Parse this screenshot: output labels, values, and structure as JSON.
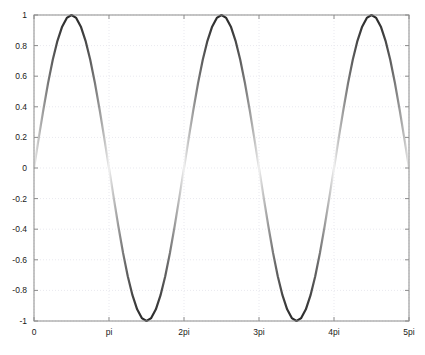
{
  "chart_data": {
    "type": "line",
    "title": "",
    "subtitle": "",
    "xlabel": "",
    "ylabel": "",
    "xlim": [
      0,
      15.70796
    ],
    "ylim": [
      -1.0,
      1.0
    ],
    "grid": true,
    "grid_style": "dotted",
    "legend": null,
    "legend_position": "none",
    "background_color": "#ffffff",
    "axes_color": "#8c8c8c",
    "grid_color": "#e9e9ef",
    "line_color_dark": "#2a2a2a",
    "line_color_light": "#f2f2f2",
    "line_width": 2.2,
    "color_mapping_note": "Line shading varies with |y|: darkest at |y|=1, lightest at y=0",
    "xticks": [
      0,
      3.14159,
      6.28319,
      9.42478,
      12.56637,
      15.70796
    ],
    "xtick_labels": [
      "0",
      "pi",
      "2pi",
      "3pi",
      "4pi",
      "5pi"
    ],
    "yticks": [
      1,
      0.8,
      0.6,
      0.4,
      0.2,
      0,
      -0.2,
      -0.4,
      -0.6,
      -0.8,
      -1
    ],
    "ytick_labels": [
      "1",
      "0.8",
      "0.6",
      "0.4",
      "0.2",
      "0",
      "-0.2",
      "-0.4",
      "-0.6",
      "-0.8",
      "-1"
    ],
    "series": [
      {
        "name": "sin(x)",
        "function": "y = sin(x)",
        "x": [
          0.0,
          0.19635,
          0.3927,
          0.58905,
          0.7854,
          0.98175,
          1.1781,
          1.37445,
          1.5708,
          1.76715,
          1.9635,
          2.15984,
          2.35619,
          2.55254,
          2.74889,
          2.94524,
          3.14159,
          3.33794,
          3.53429,
          3.73064,
          3.92699,
          4.12334,
          4.31969,
          4.51604,
          4.71239,
          4.90874,
          5.10509,
          5.30144,
          5.49779,
          5.69414,
          5.89049,
          6.08684,
          6.28319,
          6.47953,
          6.67588,
          6.87223,
          7.06858,
          7.26493,
          7.46128,
          7.65763,
          7.85398,
          8.05033,
          8.24668,
          8.44303,
          8.63938,
          8.83573,
          9.03208,
          9.22843,
          9.42478,
          9.62113,
          9.81748,
          10.01383,
          10.21018,
          10.40653,
          10.60288,
          10.79922,
          10.99557,
          11.19192,
          11.38827,
          11.58462,
          11.78097,
          11.97732,
          12.17367,
          12.37002,
          12.56637,
          12.76272,
          12.95907,
          13.15542,
          13.35177,
          13.54812,
          13.74447,
          13.94082,
          14.13717,
          14.33352,
          14.52987,
          14.72622,
          14.92257,
          15.11891,
          15.31526,
          15.51161,
          15.70796
        ],
        "y": [
          0.0,
          0.19509,
          0.38268,
          0.55557,
          0.70711,
          0.83147,
          0.92388,
          0.98079,
          1.0,
          0.98079,
          0.92388,
          0.83147,
          0.70711,
          0.55557,
          0.38268,
          0.19509,
          0.0,
          -0.19509,
          -0.38268,
          -0.55557,
          -0.70711,
          -0.83147,
          -0.92388,
          -0.98079,
          -1.0,
          -0.98079,
          -0.92388,
          -0.83147,
          -0.70711,
          -0.55557,
          -0.38268,
          -0.19509,
          0.0,
          0.19509,
          0.38268,
          0.55557,
          0.70711,
          0.83147,
          0.92388,
          0.98079,
          1.0,
          0.98079,
          0.92388,
          0.83147,
          0.70711,
          0.55557,
          0.38268,
          0.19509,
          0.0,
          -0.19509,
          -0.38268,
          -0.55557,
          -0.70711,
          -0.83147,
          -0.92388,
          -0.98079,
          -1.0,
          -0.98079,
          -0.92388,
          -0.83147,
          -0.70711,
          -0.55557,
          -0.38268,
          -0.19509,
          0.0,
          0.19509,
          0.38268,
          0.55557,
          0.70711,
          0.83147,
          0.92388,
          0.98079,
          1.0,
          0.98079,
          0.92388,
          0.83147,
          0.70711,
          0.55557,
          0.38268,
          0.19509,
          0.0
        ]
      }
    ],
    "periods_shown": 2.5,
    "amplitude": 1.0,
    "peaks": [
      {
        "x_label": "0.5pi",
        "x": 1.5708,
        "y": 1.0
      },
      {
        "x_label": "2.5pi",
        "x": 7.85398,
        "y": 1.0
      },
      {
        "x_label": "4.5pi",
        "x": 14.13717,
        "y": 1.0
      }
    ],
    "troughs": [
      {
        "x_label": "1.5pi",
        "x": 4.71239,
        "y": -1.0
      },
      {
        "x_label": "3.5pi",
        "x": 10.99557,
        "y": -1.0
      }
    ],
    "zero_crossings": [
      0,
      3.14159,
      6.28319,
      9.42478,
      12.56637,
      15.70796
    ]
  },
  "axes_geometry": {
    "left": 34,
    "right": 409,
    "top": 15,
    "bottom": 321
  }
}
